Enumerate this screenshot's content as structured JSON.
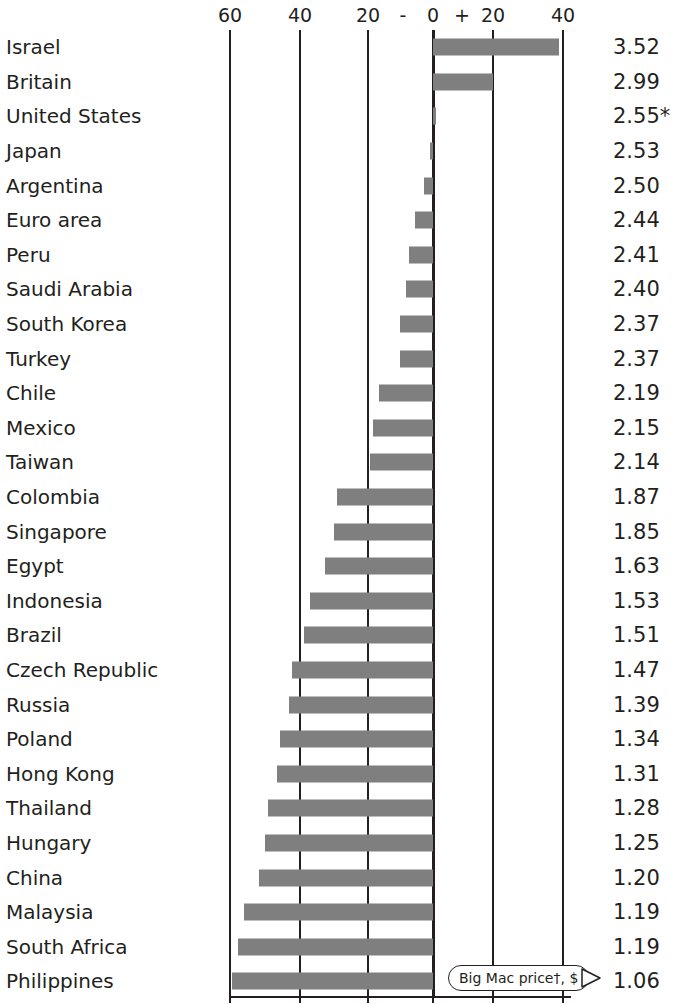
{
  "chart_data": {
    "type": "bar",
    "title": "",
    "subtitle": "",
    "xlabel": "Under(-)/over(+) valuation against the dollar, %",
    "ylabel": "",
    "orientation": "horizontal",
    "grid": true,
    "legend_position": "none",
    "xlim": [
      -70,
      50
    ],
    "axis_ticks": [
      {
        "label": "60",
        "value": -60,
        "x": 230
      },
      {
        "label": "40",
        "value": -40,
        "x": 300
      },
      {
        "label": "20",
        "value": -20,
        "x": 368
      },
      {
        "label": "0",
        "value": 0,
        "x": 433
      },
      {
        "label": "20",
        "value": 20,
        "x": 493
      },
      {
        "label": "40",
        "value": 40,
        "x": 563
      }
    ],
    "axis_signs": [
      {
        "label": "-",
        "x": 403
      },
      {
        "label": "+",
        "x": 462
      }
    ],
    "categories": [
      "Israel",
      "Britain",
      "United States",
      "Japan",
      "Argentina",
      "Euro area",
      "Peru",
      "Saudi Arabia",
      "South Korea",
      "Turkey",
      "Chile",
      "Mexico",
      "Taiwan",
      "Colombia",
      "Singapore",
      "Egypt",
      "Indonesia",
      "Brazil",
      "Czech Republic",
      "Russia",
      "Poland",
      "Hong Kong",
      "Thailand",
      "Hungary",
      "China",
      "Malaysia",
      "South Africa",
      "Philippines"
    ],
    "values": [
      42,
      20,
      0.5,
      -1,
      -3,
      -6,
      -8,
      -9,
      -11,
      -11,
      -18,
      -20,
      -21,
      -32,
      -33,
      -36,
      -41,
      -43,
      -47,
      -48,
      -51,
      -52,
      -55,
      -56,
      -58,
      -63,
      -65,
      -67
    ],
    "value_label_header": "Big Mac price, $",
    "value_labels": [
      "3.52",
      "2.99",
      "2.55*",
      "2.53",
      "2.50",
      "2.44",
      "2.41",
      "2.40",
      "2.37",
      "2.37",
      "2.19",
      "2.15",
      "2.14",
      "1.87",
      "1.85",
      "1.63",
      "1.53",
      "1.51",
      "1.47",
      "1.39",
      "1.34",
      "1.31",
      "1.28",
      "1.25",
      "1.20",
      "1.19",
      "1.19",
      "1.06"
    ],
    "bar_color": "#7f7f7f",
    "axis_color": "#231f20",
    "background": "#ffffff"
  },
  "callout": {
    "label": "Big Mac price†, $",
    "arrow": "triangle-right-icon"
  },
  "rows": [
    {
      "country": "Israel",
      "value": 42,
      "price": "3.52"
    },
    {
      "country": "Britain",
      "value": 20,
      "price": "2.99"
    },
    {
      "country": "United States",
      "value": 0.5,
      "price": "2.55*"
    },
    {
      "country": "Japan",
      "value": -1,
      "price": "2.53"
    },
    {
      "country": "Argentina",
      "value": -3,
      "price": "2.50"
    },
    {
      "country": "Euro area",
      "value": -6,
      "price": "2.44"
    },
    {
      "country": "Peru",
      "value": -8,
      "price": "2.41"
    },
    {
      "country": "Saudi Arabia",
      "value": -9,
      "price": "2.40"
    },
    {
      "country": "South Korea",
      "value": -11,
      "price": "2.37"
    },
    {
      "country": "Turkey",
      "value": -11,
      "price": "2.37"
    },
    {
      "country": "Chile",
      "value": -18,
      "price": "2.19"
    },
    {
      "country": "Mexico",
      "value": -20,
      "price": "2.15"
    },
    {
      "country": "Taiwan",
      "value": -21,
      "price": "2.14"
    },
    {
      "country": "Colombia",
      "value": -32,
      "price": "1.87"
    },
    {
      "country": "Singapore",
      "value": -33,
      "price": "1.85"
    },
    {
      "country": "Egypt",
      "value": -36,
      "price": "1.63"
    },
    {
      "country": "Indonesia",
      "value": -41,
      "price": "1.53"
    },
    {
      "country": "Brazil",
      "value": -43,
      "price": "1.51"
    },
    {
      "country": "Czech Republic",
      "value": -47,
      "price": "1.47"
    },
    {
      "country": "Russia",
      "value": -48,
      "price": "1.39"
    },
    {
      "country": "Poland",
      "value": -51,
      "price": "1.34"
    },
    {
      "country": "Hong Kong",
      "value": -52,
      "price": "1.31"
    },
    {
      "country": "Thailand",
      "value": -55,
      "price": "1.28"
    },
    {
      "country": "Hungary",
      "value": -56,
      "price": "1.25"
    },
    {
      "country": "China",
      "value": -58,
      "price": "1.20"
    },
    {
      "country": "Malaysia",
      "value": -63,
      "price": "1.19"
    },
    {
      "country": "South Africa",
      "value": -65,
      "price": "1.19"
    },
    {
      "country": "Philippines",
      "value": -67,
      "price": "1.06"
    }
  ]
}
